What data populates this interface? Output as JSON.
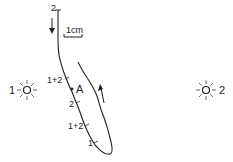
{
  "diagram": {
    "scale_bar": {
      "label": "1cm"
    },
    "light_sources": [
      {
        "id": "light-1",
        "label": "1"
      },
      {
        "id": "light-2",
        "label": "2"
      }
    ],
    "path_labels": {
      "start": "2",
      "point_a": "A",
      "marks": [
        "1+2",
        "2",
        "1+2",
        "1"
      ]
    },
    "colors": {
      "ink": "#222222",
      "background": "#ffffff"
    }
  }
}
